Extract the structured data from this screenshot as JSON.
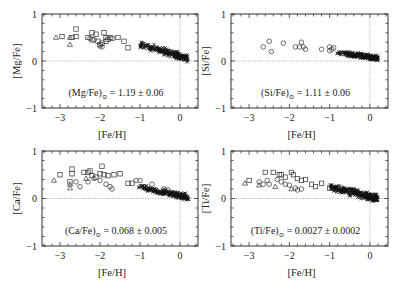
{
  "chart_data": [
    {
      "type": "scatter",
      "panel": "top-left",
      "xlabel": "[Fe/H]",
      "ylabel": "[Mg/Fe]",
      "xlim": [
        -3.45,
        0.45
      ],
      "ylim": [
        -1,
        1
      ],
      "xticks": [
        "-3",
        "-2",
        "-1",
        "0"
      ],
      "yticks": [
        "-1",
        "0",
        "1"
      ],
      "annotation": "(Mg/Fe)⊙ = 1.19 ± 0.06",
      "annotation_main": "(Mg/Fe)",
      "annotation_sub": "⊙",
      "annotation_value": " = 1.19 ± 0.06",
      "reference_lines": {
        "y": 0,
        "x": 0
      },
      "series": [
        {
          "name": "triangles",
          "marker": "triangle",
          "points": [
            [
              -3.1,
              0.5
            ],
            [
              -2.75,
              0.5
            ],
            [
              -2.75,
              0.35
            ]
          ]
        },
        {
          "name": "squares",
          "marker": "square",
          "points": [
            [
              -2.95,
              0.52
            ],
            [
              -2.7,
              0.5
            ],
            [
              -2.6,
              0.68
            ],
            [
              -2.6,
              0.52
            ],
            [
              -2.3,
              0.5
            ],
            [
              -2.2,
              0.6
            ],
            [
              -2.1,
              0.57
            ],
            [
              -2.2,
              0.45
            ],
            [
              -2.05,
              0.42
            ],
            [
              -1.95,
              0.38
            ],
            [
              -1.9,
              0.6
            ],
            [
              -1.85,
              0.5
            ],
            [
              -1.8,
              0.46
            ],
            [
              -1.75,
              0.5
            ],
            [
              -1.7,
              0.48
            ],
            [
              -1.55,
              0.5
            ],
            [
              -1.4,
              0.42
            ],
            [
              -1.3,
              0.28
            ],
            [
              -2.0,
              0.35
            ],
            [
              -1.85,
              0.42
            ]
          ]
        },
        {
          "name": "circles",
          "marker": "circle",
          "points": [
            [
              -2.25,
              0.48
            ],
            [
              -2.15,
              0.45
            ],
            [
              -2.0,
              0.32
            ],
            [
              -1.95,
              0.3
            ]
          ]
        },
        {
          "name": "crosses",
          "marker": "x",
          "cluster": {
            "x_from": -1.0,
            "x_to": 0.2,
            "y_at_from": 0.35,
            "y_at_to": 0.05,
            "spread": 0.1,
            "n": 220
          }
        }
      ]
    },
    {
      "type": "scatter",
      "panel": "top-right",
      "xlabel": "[Fe/H]",
      "ylabel": "[Si/Fe]",
      "xlim": [
        -3.45,
        0.45
      ],
      "ylim": [
        -1,
        1
      ],
      "xticks": [
        "-3",
        "-2",
        "-1",
        "0"
      ],
      "yticks": [
        "-1",
        "0",
        "1"
      ],
      "annotation": "(Si/Fe)⊙ = 1.11 ± 0.06",
      "annotation_main": "(Si/Fe)",
      "annotation_sub": "⊙",
      "annotation_value": " = 1.11 ± 0.06",
      "reference_lines": {
        "y": 0,
        "x": 0
      },
      "series": [
        {
          "name": "circles",
          "marker": "circle",
          "points": [
            [
              -2.65,
              0.3
            ],
            [
              -2.5,
              0.42
            ],
            [
              -2.45,
              0.2
            ],
            [
              -2.15,
              0.38
            ],
            [
              -1.85,
              0.3
            ],
            [
              -1.75,
              0.3
            ],
            [
              -1.7,
              0.4
            ],
            [
              -1.65,
              0.3
            ],
            [
              -1.6,
              0.25
            ],
            [
              -1.2,
              0.25
            ],
            [
              -1.0,
              0.3
            ],
            [
              -0.95,
              0.25
            ],
            [
              -0.9,
              0.28
            ],
            [
              -1.0,
              0.22
            ]
          ]
        },
        {
          "name": "crosses",
          "marker": "x",
          "cluster": {
            "x_from": -0.85,
            "x_to": 0.2,
            "y_at_from": 0.2,
            "y_at_to": 0.05,
            "spread": 0.08,
            "n": 220
          }
        }
      ]
    },
    {
      "type": "scatter",
      "panel": "bottom-left",
      "xlabel": "[Fe/H]",
      "ylabel": "[Ca/Fe]",
      "xlim": [
        -3.45,
        0.45
      ],
      "ylim": [
        -1,
        1
      ],
      "xticks": [
        "-3",
        "-2",
        "-1",
        "0"
      ],
      "yticks": [
        "-1",
        "0",
        "1"
      ],
      "annotation": "(Ca/Fe)⊙ = 0.068 ± 0.005",
      "annotation_main": "(Ca/Fe)",
      "annotation_sub": "⊙",
      "annotation_value": " = 0.068 ± 0.005",
      "reference_lines": {
        "y": 0,
        "x": 0
      },
      "series": [
        {
          "name": "triangles",
          "marker": "triangle",
          "points": [
            [
              -3.15,
              0.38
            ],
            [
              -2.75,
              0.22
            ],
            [
              -2.75,
              0.3
            ],
            [
              -2.35,
              0.42
            ]
          ]
        },
        {
          "name": "squares",
          "marker": "square",
          "points": [
            [
              -3.0,
              0.5
            ],
            [
              -2.7,
              0.62
            ],
            [
              -2.7,
              0.52
            ],
            [
              -2.4,
              0.55
            ],
            [
              -2.3,
              0.55
            ],
            [
              -2.25,
              0.58
            ],
            [
              -2.1,
              0.45
            ],
            [
              -2.0,
              0.52
            ],
            [
              -1.95,
              0.68
            ],
            [
              -1.9,
              0.5
            ],
            [
              -1.8,
              0.48
            ],
            [
              -1.65,
              0.5
            ],
            [
              -1.5,
              0.52
            ],
            [
              -1.3,
              0.32
            ],
            [
              -1.2,
              0.32
            ],
            [
              -2.75,
              0.35
            ],
            [
              -2.2,
              0.48
            ]
          ]
        },
        {
          "name": "circles",
          "marker": "circle",
          "points": [
            [
              -2.6,
              0.35
            ],
            [
              -2.5,
              0.25
            ],
            [
              -2.3,
              0.35
            ],
            [
              -2.15,
              0.42
            ],
            [
              -2.0,
              0.38
            ],
            [
              -1.85,
              0.3
            ],
            [
              -1.75,
              0.25
            ],
            [
              -1.7,
              0.2
            ],
            [
              -1.1,
              0.38
            ],
            [
              -1.0,
              0.38
            ],
            [
              -0.9,
              0.25
            ],
            [
              -0.7,
              0.3
            ],
            [
              -0.4,
              0.2
            ],
            [
              -0.3,
              0.18
            ]
          ]
        },
        {
          "name": "crosses",
          "marker": "x",
          "cluster": {
            "x_from": -1.05,
            "x_to": 0.2,
            "y_at_from": 0.25,
            "y_at_to": 0.02,
            "spread": 0.09,
            "n": 200
          }
        }
      ]
    },
    {
      "type": "scatter",
      "panel": "bottom-right",
      "xlabel": "[Fe/H]",
      "ylabel": "[Ti/Fe]",
      "xlim": [
        -3.45,
        0.45
      ],
      "ylim": [
        -1,
        1
      ],
      "xticks": [
        "-3",
        "-2",
        "-1",
        "0"
      ],
      "yticks": [
        "-1",
        "0",
        "1"
      ],
      "annotation": "(Ti/Fe)⊙ = 0.0027 ± 0.0002",
      "annotation_main": "(Ti/Fe)",
      "annotation_sub": "⊙",
      "annotation_value": " = 0.0027 ± 0.0002",
      "reference_lines": {
        "y": 0,
        "x": 0
      },
      "series": [
        {
          "name": "triangles",
          "marker": "triangle",
          "points": [
            [
              -3.1,
              0.32
            ],
            [
              -2.75,
              0.28
            ],
            [
              -2.35,
              0.25
            ],
            [
              -1.95,
              0.2
            ]
          ]
        },
        {
          "name": "squares",
          "marker": "square",
          "points": [
            [
              -3.0,
              0.38
            ],
            [
              -2.6,
              0.55
            ],
            [
              -2.4,
              0.55
            ],
            [
              -2.25,
              0.5
            ],
            [
              -2.2,
              0.5
            ],
            [
              -2.1,
              0.45
            ],
            [
              -1.95,
              0.55
            ],
            [
              -1.9,
              0.5
            ],
            [
              -1.8,
              0.42
            ],
            [
              -1.7,
              0.38
            ],
            [
              -1.6,
              0.4
            ],
            [
              -1.45,
              0.3
            ],
            [
              -1.35,
              0.25
            ],
            [
              -1.2,
              0.32
            ],
            [
              -1.0,
              0.22
            ]
          ]
        },
        {
          "name": "circles",
          "marker": "circle",
          "points": [
            [
              -2.75,
              0.35
            ],
            [
              -2.65,
              0.3
            ],
            [
              -2.55,
              0.38
            ],
            [
              -2.5,
              0.3
            ],
            [
              -2.3,
              0.4
            ],
            [
              -2.2,
              0.35
            ],
            [
              -2.1,
              0.3
            ],
            [
              -2.0,
              0.28
            ],
            [
              -1.85,
              0.22
            ],
            [
              -1.8,
              0.18
            ],
            [
              -1.7,
              0.2
            ],
            [
              -0.9,
              0.2
            ],
            [
              -0.7,
              0.22
            ]
          ]
        },
        {
          "name": "crosses",
          "marker": "x",
          "cluster": {
            "x_from": -1.0,
            "x_to": 0.2,
            "y_at_from": 0.25,
            "y_at_to": 0.0,
            "spread": 0.12,
            "n": 260
          }
        }
      ]
    }
  ],
  "figure": {
    "bottom_caption_fragment": "",
    "colors": {
      "ink": "#222222",
      "reference": "#888888",
      "background": "#ffffff"
    }
  }
}
